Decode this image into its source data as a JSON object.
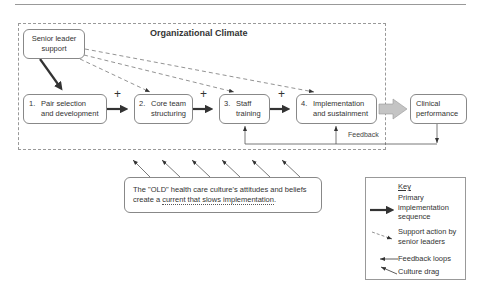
{
  "diagram": {
    "title": "Organizational Climate",
    "senior_leader": "Senior leader support",
    "senior_leader_lines": [
      "Senior leader",
      "support"
    ],
    "steps": [
      {
        "num": "1.",
        "lines": [
          "Pair selection",
          "and development"
        ]
      },
      {
        "num": "2.",
        "lines": [
          "Core team",
          "structuring"
        ]
      },
      {
        "num": "3.",
        "lines": [
          "Staff",
          "training"
        ]
      },
      {
        "num": "4.",
        "lines": [
          "Implementation",
          "and sustainment"
        ]
      }
    ],
    "plus_sign": "+",
    "outcome_lines": [
      "Clinical",
      "performance"
    ],
    "feedback_label": "Feedback",
    "culture_text_1": "The \"OLD\" health care culture's attitudes and beliefs",
    "culture_text_2a": "create a ",
    "culture_text_2b": "current that slows implementation",
    "culture_text_2c": ".",
    "key": {
      "title": "Key",
      "items": [
        {
          "icon": "thick-solid-arrow",
          "lines": [
            "Primary",
            "implementation",
            "sequence"
          ]
        },
        {
          "icon": "dashed-arrow",
          "lines": [
            "Support action by",
            "senior leaders"
          ]
        },
        {
          "icon": "thin-left-arrow",
          "lines": [
            "Feedback loops"
          ]
        },
        {
          "icon": "thin-diagonal-arrow",
          "lines": [
            "Culture drag"
          ]
        }
      ]
    },
    "colors": {
      "box_border": "#888888",
      "text": "#333333",
      "gray_arrow": "#bbbbbb"
    }
  }
}
